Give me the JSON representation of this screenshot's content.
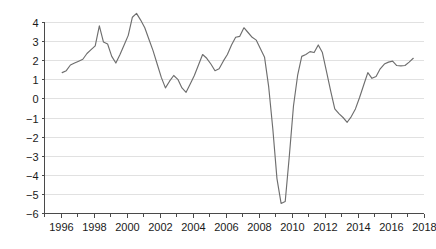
{
  "chart_data": {
    "type": "line",
    "title": "",
    "subtitle": "",
    "xlabel": "",
    "ylabel": "",
    "xlim": [
      1995.0,
      2018.0
    ],
    "ylim": [
      -6,
      4
    ],
    "grid": true,
    "legend": false,
    "legend_position": "none",
    "line_color": "#6e6e6e",
    "gridline_color": "#d9d9d9",
    "axis_color": "#4a4a4a",
    "background_color": "#ffffff",
    "x_ticks": [
      1996,
      1998,
      2000,
      2002,
      2004,
      2006,
      2008,
      2010,
      2012,
      2014,
      2016,
      2018
    ],
    "x_tick_labels": [
      "1996",
      "1998",
      "2000",
      "2002",
      "2004",
      "2006",
      "2008",
      "2010",
      "2012",
      "2014",
      "2016",
      "2018"
    ],
    "x_minor_ticks": [
      1995,
      1997,
      1999,
      2001,
      2003,
      2005,
      2007,
      2009,
      2011,
      2013,
      2015,
      2017
    ],
    "y_ticks": [
      4,
      3,
      2,
      1,
      0,
      -1,
      -2,
      -3,
      -4,
      -5,
      -6
    ],
    "y_tick_labels": [
      "4",
      "3",
      "2",
      "1",
      "0",
      "−1",
      "−2",
      "−3",
      "−4",
      "−5",
      "−6"
    ],
    "series": [
      {
        "name": "series-1",
        "color": "#6e6e6e",
        "x": [
          1996.1,
          1996.35,
          1996.6,
          1996.85,
          1997.1,
          1997.35,
          1997.6,
          1997.85,
          1998.1,
          1998.35,
          1998.6,
          1998.85,
          1999.1,
          1999.35,
          1999.6,
          1999.85,
          2000.1,
          2000.35,
          2000.6,
          2000.85,
          2001.1,
          2001.35,
          2001.6,
          2001.85,
          2002.1,
          2002.35,
          2002.6,
          2002.85,
          2003.1,
          2003.35,
          2003.6,
          2003.85,
          2004.1,
          2004.35,
          2004.6,
          2004.85,
          2005.1,
          2005.35,
          2005.6,
          2005.85,
          2006.1,
          2006.35,
          2006.6,
          2006.85,
          2007.1,
          2007.35,
          2007.6,
          2007.85,
          2008.1,
          2008.35,
          2008.6,
          2008.85,
          2009.1,
          2009.35,
          2009.6,
          2009.85,
          2010.1,
          2010.35,
          2010.6,
          2010.85,
          2011.1,
          2011.35,
          2011.6,
          2011.85,
          2012.1,
          2012.35,
          2012.6,
          2012.85,
          2013.1,
          2013.35,
          2013.6,
          2013.85,
          2014.1,
          2014.35,
          2014.6,
          2014.85,
          2015.1,
          2015.35,
          2015.6,
          2015.85,
          2016.1,
          2016.35,
          2016.6,
          2016.85,
          2017.1,
          2017.35
        ],
        "values": [
          1.35,
          1.45,
          1.75,
          1.85,
          1.95,
          2.05,
          2.35,
          2.55,
          2.75,
          3.8,
          2.95,
          2.85,
          2.2,
          1.85,
          2.3,
          2.8,
          3.3,
          4.25,
          4.45,
          4.1,
          3.7,
          3.1,
          2.5,
          1.8,
          1.1,
          0.55,
          0.9,
          1.2,
          1.0,
          0.55,
          0.32,
          0.75,
          1.2,
          1.75,
          2.3,
          2.1,
          1.8,
          1.45,
          1.55,
          1.95,
          2.3,
          2.8,
          3.2,
          3.25,
          3.7,
          3.45,
          3.2,
          3.05,
          2.6,
          2.15,
          0.6,
          -1.6,
          -4.2,
          -5.5,
          -5.4,
          -3.0,
          -0.4,
          1.2,
          2.2,
          2.3,
          2.45,
          2.4,
          2.8,
          2.4,
          1.4,
          0.4,
          -0.55,
          -0.8,
          -1.0,
          -1.25,
          -0.95,
          -0.55,
          0.05,
          0.7,
          1.35,
          1.05,
          1.15,
          1.55,
          1.8,
          1.9,
          1.95,
          1.72,
          1.7,
          1.72,
          1.9,
          2.1
        ]
      }
    ]
  }
}
